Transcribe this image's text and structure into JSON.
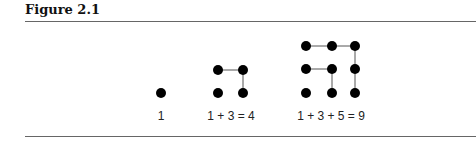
{
  "figure": {
    "title": "Figure 2.1"
  },
  "diagram": {
    "dot_color": "#000000",
    "line_color": "#555555",
    "groups": [
      {
        "label": "1",
        "label_x": 161,
        "dots": [
          [
            161,
            93
          ]
        ],
        "lines": []
      },
      {
        "label": "1 + 3 = 4",
        "label_x": 231,
        "dots": [
          [
            218,
            70
          ],
          [
            243,
            70
          ],
          [
            218,
            93
          ],
          [
            243,
            93
          ]
        ],
        "lines": [
          [
            [
              218,
              70
            ],
            [
              243,
              70
            ]
          ],
          [
            [
              243,
              70
            ],
            [
              243,
              93
            ]
          ]
        ]
      },
      {
        "label": "1 + 3 + 5 = 9",
        "label_x": 331,
        "dots": [
          [
            306,
            46
          ],
          [
            332,
            46
          ],
          [
            355,
            46
          ],
          [
            306,
            69
          ],
          [
            332,
            69
          ],
          [
            355,
            69
          ],
          [
            306,
            93
          ],
          [
            332,
            93
          ],
          [
            355,
            93
          ]
        ],
        "lines": [
          [
            [
              306,
              46
            ],
            [
              332,
              46
            ]
          ],
          [
            [
              332,
              46
            ],
            [
              355,
              46
            ]
          ],
          [
            [
              355,
              46
            ],
            [
              355,
              93
            ]
          ],
          [
            [
              306,
              69
            ],
            [
              332,
              69
            ]
          ],
          [
            [
              332,
              69
            ],
            [
              332,
              93
            ]
          ]
        ]
      }
    ]
  }
}
